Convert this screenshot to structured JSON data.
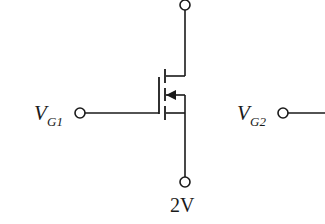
{
  "diagram": {
    "type": "circuit-schematic",
    "component": "MOSFET (PMOS symbol, body/arrow pointing inward)",
    "labels": {
      "gate1": {
        "main": "V",
        "sub": "G1"
      },
      "gate2": {
        "main": "V",
        "sub": "G2"
      },
      "source_voltage": "2V"
    },
    "terminals": [
      {
        "id": "drain-top",
        "label": ""
      },
      {
        "id": "gate-vg1",
        "label": "V_G1"
      },
      {
        "id": "source-bottom",
        "label": "2V"
      },
      {
        "id": "gate-vg2",
        "label": "V_G2"
      }
    ],
    "colors": {
      "line": "#1a1a1a",
      "background": "#ffffff"
    }
  }
}
